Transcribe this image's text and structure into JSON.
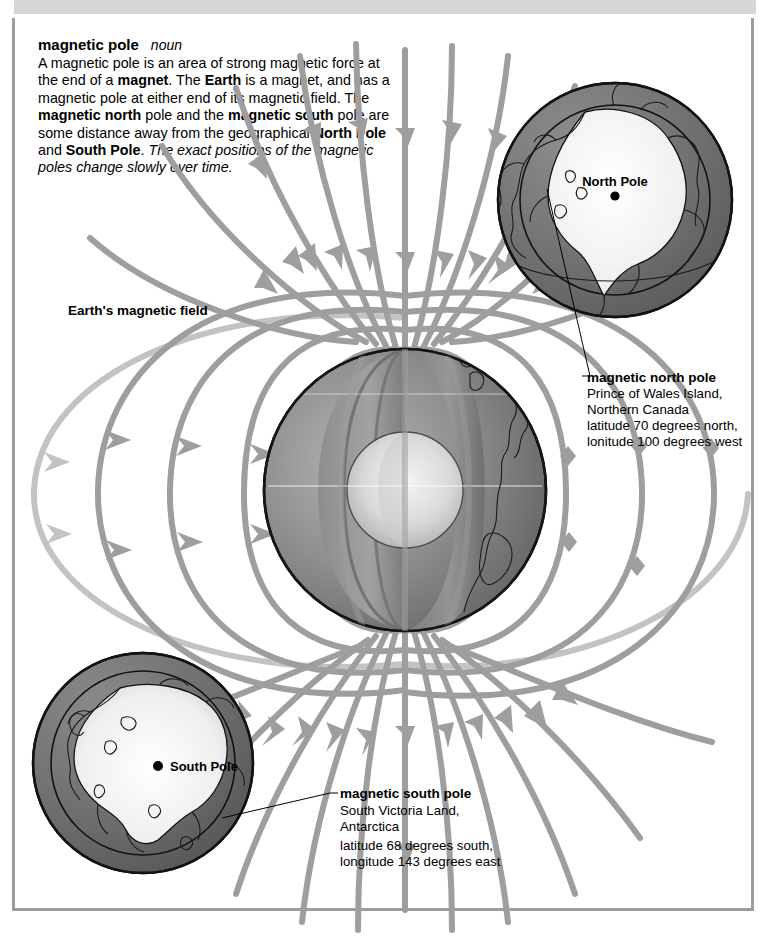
{
  "page": {
    "headword": "magnetic pole",
    "part_of_speech": "noun",
    "definition_runs": [
      {
        "text": "A magnetic pole is an area of strong magnetic force at the end of a ",
        "style": "plain"
      },
      {
        "text": "magnet",
        "style": "bold"
      },
      {
        "text": ". The ",
        "style": "plain"
      },
      {
        "text": "Earth",
        "style": "bold"
      },
      {
        "text": " is a magnet, and has a magnetic pole at either end of its magnetic field. The ",
        "style": "plain"
      },
      {
        "text": "magnetic north",
        "style": "bold"
      },
      {
        "text": " pole and the ",
        "style": "plain"
      },
      {
        "text": "magnetic south",
        "style": "bold"
      },
      {
        "text": " pole are some distance away from the geographical ",
        "style": "plain"
      },
      {
        "text": "North Pole",
        "style": "bold"
      },
      {
        "text": " and ",
        "style": "plain"
      },
      {
        "text": "South Pole",
        "style": "bold"
      },
      {
        "text": ". ",
        "style": "plain"
      },
      {
        "text": "The exact positions of the magnetic poles change slowly over time.",
        "style": "italic"
      }
    ]
  },
  "diagram": {
    "field_label": "Earth's magnetic field",
    "north_inset_label": "North Pole",
    "south_inset_label": "South Pole",
    "callout_north": {
      "title": "magnetic north pole",
      "lines": [
        "Prince of Wales Island,",
        "Northern Canada",
        "latitude 70 degrees north,",
        "lonitude 100 degrees west"
      ]
    },
    "callout_south": {
      "title": "magnetic south pole",
      "lines": [
        "South Victoria Land,",
        "Antarctica",
        "latitude 68 degrees south,",
        "longitude 143 degrees east"
      ]
    }
  },
  "colors": {
    "page_background": "#ffffff",
    "top_band": "#d6d6d6",
    "frame_border": "#9d9d9d",
    "field_line": "#9e9e9e",
    "field_line_faint": "#c3c3c3",
    "globe_dark": "#5f5f5f",
    "globe_mid": "#8c8c8c",
    "globe_light": "#e8e8e8",
    "ocean_ring": "#6f6f6f",
    "landmass_light": "#f2f2f2",
    "outline": "#1a1a1a",
    "text": "#000000"
  }
}
